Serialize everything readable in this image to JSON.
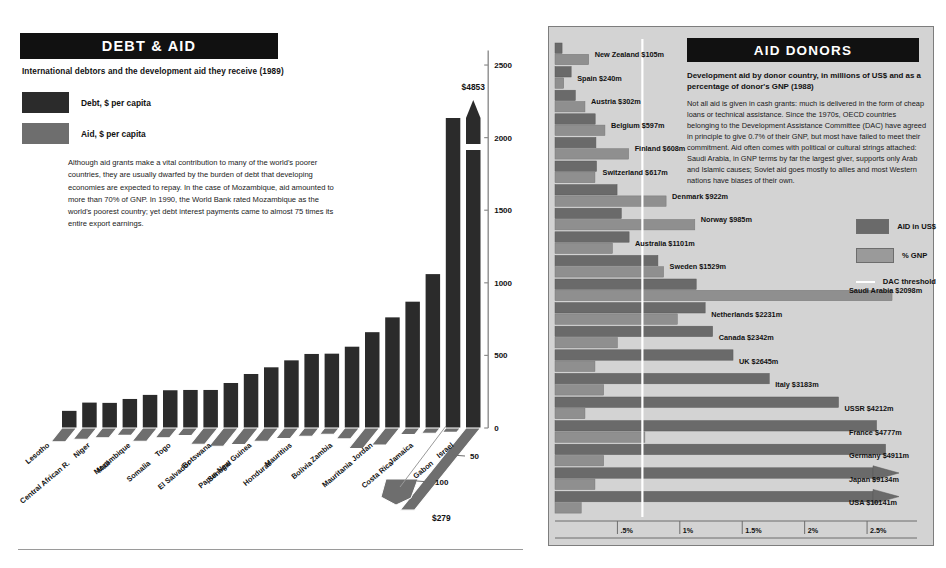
{
  "colors": {
    "debt_bar": "#2b2b2b",
    "aid_bar": "#6e6e6e",
    "donor_aid": "#6a6a6a",
    "donor_gnp": "#8f8f8f",
    "panel_bg": "#d3d3d3",
    "banner_bg": "#111111",
    "threshold_line": "#ffffff"
  },
  "left": {
    "banner_title": "DEBT & AID",
    "subtitle": "International debtors and the development aid they receive (1989)",
    "legend": [
      {
        "label": "Debt, $ per capita",
        "swatch_name": "debt-swatch"
      },
      {
        "label": "Aid, $ per capita",
        "swatch_name": "aid-swatch"
      }
    ],
    "body": "Although aid grants make a vital contribution to many of the  world's poorer countries, they are usually dwarfed by the burden of debt that developing economies are expected to repay. In the case of Mozambique, aid amounted to more than 70% of GNP.  In 1990, the World Bank rated Mozambique as the world's poorest country; yet debt interest payments came to almost 75 times its entire export earnings.",
    "peak_label": "$4853",
    "aid_peak_label": "$279",
    "depth_ticks": [
      "50",
      "100"
    ]
  },
  "right": {
    "banner_title": "AID DONORS",
    "subtitle": "Development aid by donor country, in millions of US$ and as a percentage of donor's GNP (1988)",
    "body": "Not all aid is given in cash grants:  much is delivered in the form of cheap loans or technical assistance. Since the 1970s, OECD countries belonging to the Development Assistance Committee (DAC) have agreed in principle to give 0.7% of their GNP, but most have failed to meet their commitment. Aid often comes with political or cultural strings attached:  Saudi Arabia, in GNP terms by far the largest giver, supports only Arab and Islamic causes; Soviet aid goes mostly to allies and most Western nations have biases of their own.",
    "legend": [
      {
        "label": "AID in US$",
        "swatch_name": "aid-usd-swatch"
      },
      {
        "label": "% GNP",
        "swatch_name": "gnp-swatch"
      },
      {
        "label": "DAC threshold",
        "swatch_name": "dac-threshold-line"
      }
    ]
  },
  "chart_data": [
    {
      "type": "bar",
      "name": "debt-and-aid-per-capita",
      "title": "DEBT & AID",
      "subtitle": "International debtors and the development aid they receive (1989)",
      "xlabel": "",
      "ylabel": "$ per capita",
      "ylim": [
        0,
        2700
      ],
      "yticks": [
        0,
        500,
        1000,
        1500,
        2000,
        2500
      ],
      "grid": false,
      "legend_position": "top-left",
      "categories": [
        "Lesotho",
        "Central African R.",
        "Niger",
        "Mali",
        "Mozambique",
        "Somalia",
        "Togo",
        "El Salvador",
        "Botswana",
        "Senegal",
        "Papua New Guinea",
        "Honduras",
        "Mauritius",
        "Bolivia",
        "Zambia",
        "Mauritania",
        "Jordan",
        "Costa Rica",
        "Jamaica",
        "Gabon",
        "Israel"
      ],
      "series": [
        {
          "name": "Debt, $ per capita",
          "color": "#2b2b2b",
          "values": [
            118,
            175,
            173,
            200,
            228,
            260,
            262,
            262,
            310,
            372,
            418,
            466,
            510,
            512,
            560,
            660,
            762,
            870,
            1060,
            2440,
            4853
          ],
          "note": "Final bar (Israel) is broken-axis and labelled $4853"
        },
        {
          "name": "Aid, $ per capita",
          "color": "#6e6e6e",
          "values": [
            47,
            38,
            33,
            25,
            45,
            33,
            26,
            55,
            62,
            56,
            45,
            36,
            28,
            21,
            37,
            70,
            58,
            22,
            18,
            15,
            279
          ],
          "depth_axis_ticks": [
            50,
            100
          ],
          "note": "Plotted on receding depth axis; final (Israel) labelled $279"
        }
      ]
    },
    {
      "type": "bar",
      "name": "aid-donors",
      "orientation": "horizontal",
      "title": "AID DONORS",
      "subtitle": "Development aid by donor country, in millions of US$ and as a percentage of donor's GNP (1988)",
      "xlabel": "% of donor's GNP",
      "ylabel": "",
      "xticks": [
        ".5%",
        "1%",
        "1.5%",
        "2%",
        "2.5%"
      ],
      "xtick_values": [
        0.5,
        1.0,
        1.5,
        2.0,
        2.5
      ],
      "xlim": [
        0,
        2.9
      ],
      "grid": false,
      "legend_position": "right",
      "threshold": {
        "label": "DAC threshold",
        "value": 0.7,
        "color": "#ffffff"
      },
      "categories": [
        "New Zealand",
        "Spain",
        "Austria",
        "Belgium",
        "Finland",
        "Switzerland",
        "Denmark",
        "Norway",
        "Australia",
        "Sweden",
        "Saudi Arabia",
        "Netherlands",
        "Canada",
        "UK",
        "Italy",
        "USSR",
        "France",
        "Germany",
        "Japan",
        "USA"
      ],
      "labels": [
        "New Zealand $105m",
        "Spain $240m",
        "Austria $302m",
        "Belgium $597m",
        "Finland $608m",
        "Switzerland $617m",
        "Denmark $922m",
        "Norway $985m",
        "Australia $1101m",
        "Sweden $1529m",
        "Saudi Arabia $2098m",
        "Netherlands $2231m",
        "Canada $2342m",
        "UK $2645m",
        "Italy $3183m",
        "USSR $4212m",
        "France $4777m",
        "Germany $4911m",
        "Japan $9134m",
        "USA $10141m"
      ],
      "series": [
        {
          "name": "AID in US$",
          "color": "#6a6a6a",
          "unit": "US$ millions",
          "values": [
            105,
            240,
            302,
            597,
            608,
            617,
            922,
            985,
            1101,
            1529,
            2098,
            2231,
            2342,
            2645,
            3183,
            4212,
            4777,
            4911,
            9134,
            10141
          ],
          "note": "Japan and USA bars are broken/arrowed beyond the plot"
        },
        {
          "name": "% GNP",
          "color": "#8f8f8f",
          "unit": "percent of GNP",
          "values": [
            0.27,
            0.07,
            0.24,
            0.4,
            0.59,
            0.32,
            0.89,
            1.12,
            0.46,
            0.87,
            2.7,
            0.98,
            0.5,
            0.32,
            0.39,
            0.24,
            0.72,
            0.39,
            0.32,
            0.21
          ]
        }
      ]
    }
  ]
}
